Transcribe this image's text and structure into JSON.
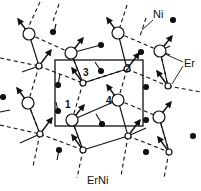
{
  "diagram": {
    "title": "ErNi",
    "labels": {
      "ni": "Ni",
      "er": "Er",
      "site_1": "1",
      "site_2": "2",
      "site_3": "3",
      "site_4": "4"
    },
    "colors": {
      "line": "#111111",
      "background": "#ffffff"
    },
    "unit_cell": {
      "x": 55,
      "y": 60,
      "width": 88,
      "height": 66
    },
    "er_large": [
      [
        29,
        34
      ],
      [
        71,
        53
      ],
      [
        118,
        33
      ],
      [
        160,
        51
      ],
      [
        28,
        103
      ],
      [
        72,
        120
      ],
      [
        118,
        100
      ],
      [
        159,
        117
      ]
    ],
    "er_small": [
      [
        39,
        66
      ],
      [
        83,
        83
      ],
      [
        127,
        69
      ],
      [
        168,
        86
      ],
      [
        40,
        134
      ],
      [
        83,
        150
      ],
      [
        128,
        136
      ],
      [
        169,
        152
      ]
    ],
    "ni_atoms": [
      [
        54,
        29
      ],
      [
        102,
        48
      ],
      [
        143,
        29
      ],
      [
        30,
        79
      ],
      [
        74,
        95
      ],
      [
        116,
        114
      ],
      [
        160,
        96
      ],
      [
        55,
        143
      ],
      [
        101,
        164
      ],
      [
        143,
        160
      ]
    ]
  }
}
